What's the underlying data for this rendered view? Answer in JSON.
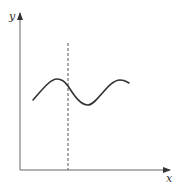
{
  "figure": {
    "type": "function-graph-sketch",
    "x_axis": {
      "label": "x"
    },
    "y_axis": {
      "label": "y"
    },
    "curve": {
      "description": "smooth sinusoidal wave, about 1.5 periods",
      "color": "#333333",
      "points": [
        [
          33,
          100
        ],
        [
          57,
          79
        ],
        [
          68,
          86
        ],
        [
          88,
          105
        ],
        [
          120,
          80
        ],
        [
          129,
          83
        ]
      ]
    },
    "vertical_line": {
      "style": "dashed",
      "x": 68,
      "color": "#555555"
    }
  }
}
